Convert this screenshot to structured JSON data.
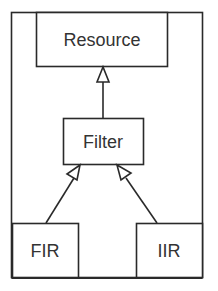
{
  "diagram": {
    "type": "uml-class-inheritance",
    "nodes": [
      {
        "id": "resource",
        "label": "Resource"
      },
      {
        "id": "filter",
        "label": "Filter"
      },
      {
        "id": "fir",
        "label": "FIR"
      },
      {
        "id": "iir",
        "label": "IIR"
      }
    ],
    "edges": [
      {
        "from": "filter",
        "to": "resource",
        "kind": "generalization"
      },
      {
        "from": "fir",
        "to": "filter",
        "kind": "generalization"
      },
      {
        "from": "iir",
        "to": "filter",
        "kind": "generalization"
      }
    ],
    "colors": {
      "stroke": "#2a2a2a",
      "text": "#333333",
      "background": "#ffffff"
    }
  }
}
